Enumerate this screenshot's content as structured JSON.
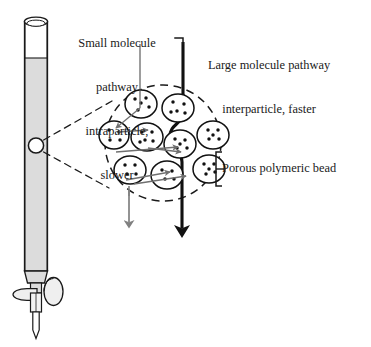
{
  "figure": {
    "type": "size-exclusion chromatography column diagram",
    "background_color": "#ffffff",
    "ink_color": "#1a1a1a",
    "gray_color": "#808080",
    "column_fill_color": "#dcdcdc"
  },
  "labels": {
    "small_molecule": {
      "line1": "Small molecule",
      "line2": "pathway",
      "line3": "intraparticle,",
      "line4": "slower",
      "text": "Small molecule pathway intraparticle, slower"
    },
    "large_molecule": {
      "line1": "Large molecule pathway",
      "line2": "interparticle, faster",
      "text": "Large molecule pathway interparticle, faster"
    },
    "bead": {
      "text": "Porous polymeric bead"
    }
  },
  "column": {
    "name": "chromatography column",
    "rim_label": "open column top",
    "packed_bed_label": "packed bed",
    "stopcock_label": "stopcock",
    "tip_label": "outlet tip",
    "callout_circle_label": "magnified region"
  },
  "diagram": {
    "magnifier_label": "magnified bead cluster",
    "dashed_boundary_label": "magnification boundary",
    "beads": [
      {
        "cx": 141,
        "cy": 104,
        "rx": 16,
        "ry": 14,
        "dots": [
          [
            -6,
            -5
          ],
          [
            5,
            -6
          ],
          [
            8,
            3
          ],
          [
            -3,
            6
          ],
          [
            0,
            -1
          ]
        ]
      },
      {
        "cx": 178,
        "cy": 108,
        "rx": 16,
        "ry": 14,
        "dots": [
          [
            -5,
            -6
          ],
          [
            6,
            -4
          ],
          [
            -1,
            3
          ],
          [
            7,
            5
          ],
          [
            -7,
            4
          ]
        ]
      },
      {
        "cx": 114,
        "cy": 135,
        "rx": 15,
        "ry": 14,
        "dots": [
          [
            -5,
            -5
          ],
          [
            5,
            -3
          ],
          [
            -4,
            5
          ],
          [
            6,
            5
          ]
        ]
      },
      {
        "cx": 147,
        "cy": 137,
        "rx": 16,
        "ry": 14,
        "dots": [
          [
            -5,
            -5
          ],
          [
            5,
            -5
          ],
          [
            -2,
            3
          ],
          [
            6,
            4
          ],
          [
            -7,
            5
          ]
        ]
      },
      {
        "cx": 180,
        "cy": 144,
        "rx": 16,
        "ry": 14,
        "dots": [
          [
            -5,
            -5
          ],
          [
            5,
            -4
          ],
          [
            -3,
            4
          ],
          [
            7,
            4
          ],
          [
            0,
            0
          ]
        ]
      },
      {
        "cx": 213,
        "cy": 135,
        "rx": 16,
        "ry": 14,
        "dots": [
          [
            -5,
            -5
          ],
          [
            5,
            -5
          ],
          [
            -4,
            4
          ],
          [
            6,
            4
          ],
          [
            0,
            0
          ]
        ]
      },
      {
        "cx": 130,
        "cy": 170,
        "rx": 16,
        "ry": 14,
        "dots": [
          [
            -5,
            -5
          ],
          [
            5,
            -5
          ],
          [
            -3,
            4
          ],
          [
            6,
            4
          ]
        ]
      },
      {
        "cx": 167,
        "cy": 175,
        "rx": 16,
        "ry": 14,
        "dots": [
          [
            -5,
            -5
          ],
          [
            5,
            -4
          ],
          [
            -2,
            4
          ],
          [
            7,
            4
          ]
        ]
      },
      {
        "cx": 209,
        "cy": 169,
        "rx": 16,
        "ry": 14,
        "dots": [
          [
            -5,
            -5
          ],
          [
            5,
            -5
          ],
          [
            -3,
            5
          ],
          [
            6,
            3
          ],
          [
            0,
            0
          ]
        ]
      }
    ],
    "arrows": {
      "small_molecule_arrow": {
        "color": "#808080",
        "width": "thin",
        "label": "slower flow arrow"
      },
      "large_molecule_arrow": {
        "color": "#111111",
        "width": "thick",
        "label": "faster flow arrow"
      }
    }
  }
}
